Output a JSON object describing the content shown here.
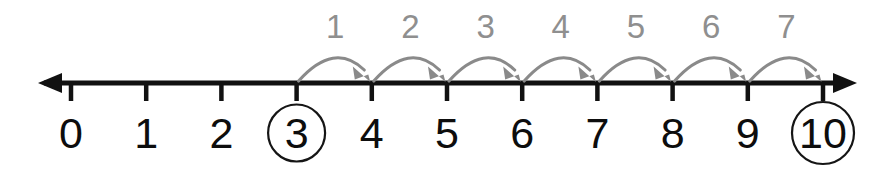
{
  "figure": {
    "background_color": "#ffffff"
  },
  "chart_data": {
    "type": "line",
    "xlabel": "",
    "ylabel": "",
    "xlim": [
      0,
      10
    ],
    "grid": false,
    "legend": null,
    "axis": {
      "orientation": "horizontal",
      "color": "#111111",
      "left_arrow": true,
      "right_arrow": true,
      "tick_color": "#111111"
    },
    "tick_labels": [
      "0",
      "1",
      "2",
      "3",
      "4",
      "5",
      "6",
      "7",
      "8",
      "9",
      "10"
    ],
    "tick_values": [
      0,
      1,
      2,
      3,
      4,
      5,
      6,
      7,
      8,
      9,
      10
    ],
    "highlighted_ticks": [
      {
        "label": "3",
        "value": 3,
        "marker": "circle"
      },
      {
        "label": "10",
        "value": 10,
        "marker": "circle"
      }
    ],
    "hops": [
      {
        "label": "1",
        "from": 3,
        "to": 4
      },
      {
        "label": "2",
        "from": 4,
        "to": 5
      },
      {
        "label": "3",
        "from": 5,
        "to": 6
      },
      {
        "label": "4",
        "from": 6,
        "to": 7
      },
      {
        "label": "5",
        "from": 7,
        "to": 8
      },
      {
        "label": "6",
        "from": 8,
        "to": 9
      },
      {
        "label": "7",
        "from": 9,
        "to": 10
      }
    ],
    "hop_count": 7,
    "start_value": 3,
    "end_value": 10,
    "colors": {
      "axis": "#111111",
      "tick_label": "#0d0d0d",
      "hop_arc": "#8a8a8a",
      "hop_label": "#8f8f8f",
      "highlight_circle": "#151515"
    }
  }
}
